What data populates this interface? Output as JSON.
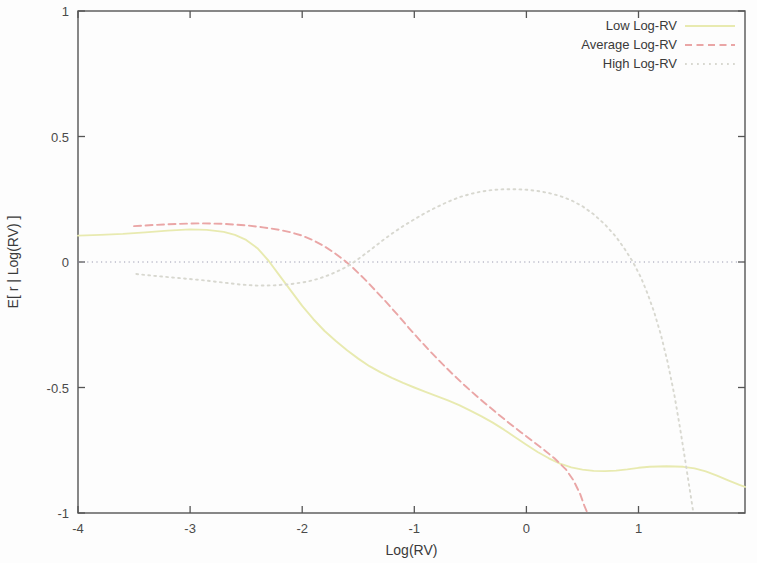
{
  "chart_data": {
    "type": "line",
    "title": "",
    "xlabel": "Log(RV)",
    "ylabel": "E[ r | Log(RV) ]",
    "xlim": [
      -4,
      1.95
    ],
    "ylim": [
      -1,
      1
    ],
    "xticks": [
      "-4",
      "-3",
      "-2",
      "-1",
      "0",
      "1"
    ],
    "xtick_values": [
      -4,
      -3,
      -2,
      -1,
      0,
      1
    ],
    "yticks": [
      "1",
      "0.5",
      "0",
      "-0.5",
      "-1"
    ],
    "ytick_values": [
      1,
      0.5,
      0,
      -0.5,
      -1
    ],
    "grid": false,
    "zero_line": true,
    "legend_position": "top-right",
    "series": [
      {
        "name": "Low Log-RV",
        "style": "solid",
        "color": "#e8eab0",
        "points": [
          [
            -4.0,
            0.105
          ],
          [
            -3.8,
            0.108
          ],
          [
            -3.6,
            0.112
          ],
          [
            -3.4,
            0.118
          ],
          [
            -3.2,
            0.125
          ],
          [
            -3.0,
            0.13
          ],
          [
            -2.85,
            0.128
          ],
          [
            -2.7,
            0.12
          ],
          [
            -2.6,
            0.108
          ],
          [
            -2.5,
            0.088
          ],
          [
            -2.4,
            0.055
          ],
          [
            -2.35,
            0.03
          ],
          [
            -2.3,
            0.005
          ],
          [
            -2.2,
            -0.055
          ],
          [
            -2.1,
            -0.115
          ],
          [
            -2.0,
            -0.175
          ],
          [
            -1.9,
            -0.228
          ],
          [
            -1.8,
            -0.275
          ],
          [
            -1.7,
            -0.315
          ],
          [
            -1.6,
            -0.352
          ],
          [
            -1.5,
            -0.385
          ],
          [
            -1.4,
            -0.415
          ],
          [
            -1.3,
            -0.44
          ],
          [
            -1.2,
            -0.462
          ],
          [
            -1.1,
            -0.482
          ],
          [
            -1.0,
            -0.5
          ],
          [
            -0.9,
            -0.517
          ],
          [
            -0.8,
            -0.534
          ],
          [
            -0.7,
            -0.551
          ],
          [
            -0.6,
            -0.57
          ],
          [
            -0.5,
            -0.592
          ],
          [
            -0.4,
            -0.615
          ],
          [
            -0.3,
            -0.64
          ],
          [
            -0.2,
            -0.668
          ],
          [
            -0.1,
            -0.698
          ],
          [
            0.0,
            -0.728
          ],
          [
            0.1,
            -0.757
          ],
          [
            0.2,
            -0.782
          ],
          [
            0.3,
            -0.803
          ],
          [
            0.4,
            -0.818
          ],
          [
            0.5,
            -0.827
          ],
          [
            0.6,
            -0.832
          ],
          [
            0.7,
            -0.833
          ],
          [
            0.8,
            -0.831
          ],
          [
            0.9,
            -0.826
          ],
          [
            1.0,
            -0.82
          ],
          [
            1.1,
            -0.816
          ],
          [
            1.25,
            -0.814
          ],
          [
            1.4,
            -0.816
          ],
          [
            1.5,
            -0.822
          ],
          [
            1.6,
            -0.834
          ],
          [
            1.7,
            -0.851
          ],
          [
            1.8,
            -0.87
          ],
          [
            1.9,
            -0.888
          ],
          [
            1.95,
            -0.896
          ]
        ]
      },
      {
        "name": "Average Log-RV",
        "style": "dashed",
        "color": "#eaa6a6",
        "points": [
          [
            -3.5,
            0.143
          ],
          [
            -3.3,
            0.148
          ],
          [
            -3.1,
            0.152
          ],
          [
            -2.9,
            0.154
          ],
          [
            -2.7,
            0.152
          ],
          [
            -2.5,
            0.146
          ],
          [
            -2.35,
            0.138
          ],
          [
            -2.2,
            0.128
          ],
          [
            -2.1,
            0.118
          ],
          [
            -2.0,
            0.105
          ],
          [
            -1.9,
            0.086
          ],
          [
            -1.8,
            0.062
          ],
          [
            -1.7,
            0.032
          ],
          [
            -1.62,
            0.005
          ],
          [
            -1.55,
            -0.022
          ],
          [
            -1.45,
            -0.065
          ],
          [
            -1.35,
            -0.112
          ],
          [
            -1.25,
            -0.16
          ],
          [
            -1.15,
            -0.21
          ],
          [
            -1.05,
            -0.262
          ],
          [
            -0.95,
            -0.312
          ],
          [
            -0.85,
            -0.36
          ],
          [
            -0.75,
            -0.406
          ],
          [
            -0.65,
            -0.45
          ],
          [
            -0.55,
            -0.492
          ],
          [
            -0.45,
            -0.532
          ],
          [
            -0.35,
            -0.57
          ],
          [
            -0.25,
            -0.607
          ],
          [
            -0.15,
            -0.643
          ],
          [
            -0.05,
            -0.678
          ],
          [
            0.05,
            -0.712
          ],
          [
            0.15,
            -0.746
          ],
          [
            0.25,
            -0.782
          ],
          [
            0.35,
            -0.825
          ],
          [
            0.42,
            -0.87
          ],
          [
            0.48,
            -0.925
          ],
          [
            0.52,
            -0.975
          ],
          [
            0.545,
            -1.0
          ]
        ]
      },
      {
        "name": "High Log-RV",
        "style": "dotted",
        "color": "#d8d8d0",
        "points": [
          [
            -3.48,
            -0.048
          ],
          [
            -3.3,
            -0.056
          ],
          [
            -3.1,
            -0.064
          ],
          [
            -2.9,
            -0.072
          ],
          [
            -2.7,
            -0.082
          ],
          [
            -2.55,
            -0.09
          ],
          [
            -2.4,
            -0.094
          ],
          [
            -2.25,
            -0.093
          ],
          [
            -2.1,
            -0.088
          ],
          [
            -1.95,
            -0.078
          ],
          [
            -1.85,
            -0.066
          ],
          [
            -1.75,
            -0.05
          ],
          [
            -1.65,
            -0.03
          ],
          [
            -1.57,
            -0.01
          ],
          [
            -1.5,
            0.012
          ],
          [
            -1.4,
            0.045
          ],
          [
            -1.3,
            0.08
          ],
          [
            -1.2,
            0.113
          ],
          [
            -1.1,
            0.143
          ],
          [
            -1.0,
            0.17
          ],
          [
            -0.9,
            0.196
          ],
          [
            -0.8,
            0.219
          ],
          [
            -0.7,
            0.24
          ],
          [
            -0.6,
            0.258
          ],
          [
            -0.5,
            0.271
          ],
          [
            -0.4,
            0.281
          ],
          [
            -0.3,
            0.287
          ],
          [
            -0.2,
            0.29
          ],
          [
            -0.1,
            0.29
          ],
          [
            0.0,
            0.288
          ],
          [
            0.1,
            0.283
          ],
          [
            0.2,
            0.275
          ],
          [
            0.3,
            0.263
          ],
          [
            0.4,
            0.246
          ],
          [
            0.5,
            0.222
          ],
          [
            0.6,
            0.19
          ],
          [
            0.7,
            0.15
          ],
          [
            0.8,
            0.1
          ],
          [
            0.88,
            0.05
          ],
          [
            0.95,
            0.0
          ],
          [
            1.02,
            -0.06
          ],
          [
            1.08,
            -0.125
          ],
          [
            1.14,
            -0.2
          ],
          [
            1.2,
            -0.29
          ],
          [
            1.26,
            -0.4
          ],
          [
            1.32,
            -0.53
          ],
          [
            1.37,
            -0.66
          ],
          [
            1.42,
            -0.8
          ],
          [
            1.46,
            -0.915
          ],
          [
            1.49,
            -1.0
          ]
        ]
      }
    ]
  },
  "legend": {
    "entries": [
      {
        "label": "Low Log-RV"
      },
      {
        "label": "Average Log-RV"
      },
      {
        "label": "High Log-RV"
      }
    ]
  }
}
